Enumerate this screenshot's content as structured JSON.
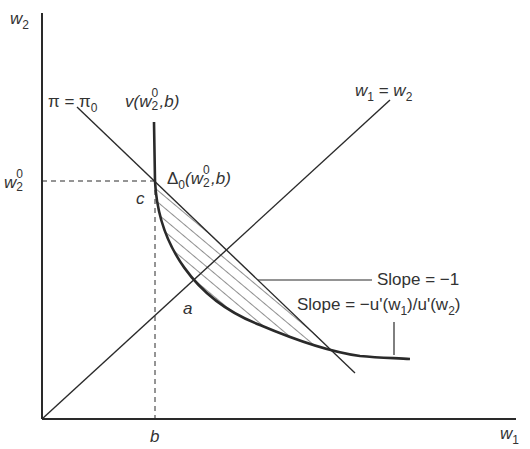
{
  "diagram": {
    "axes": {
      "y_label": "w",
      "y_label_sub": "2",
      "x_label": "w",
      "x_label_sub": "1"
    },
    "labels": {
      "pi_line": {
        "main": "π = π",
        "sub": "0"
      },
      "v_curve": {
        "pre": "v(w",
        "sup": "0",
        "sub": "2",
        "post": ",b)"
      },
      "diag_line": {
        "a": "w",
        "a_sub": "1",
        "eq": " = ",
        "b": "w",
        "b_sub": "2"
      },
      "w20": {
        "main": "w",
        "sup": "0",
        "sub": "2"
      },
      "delta": {
        "pre": "Δ",
        "sub0": "0",
        "mid": "(w",
        "sup": "0",
        "sub": "2",
        "post": ",b)"
      },
      "point_c": "c",
      "point_a": "a",
      "point_b": "b",
      "slope_minus_one": "Slope = −1",
      "slope_mrs": {
        "pre": "Slope = −u'(w",
        "sub1": "1",
        "mid": ")/u'(w",
        "sub2": "2",
        "post": ")"
      }
    },
    "colors": {
      "line": "#2a2a2a",
      "hatch": "#333333"
    }
  }
}
